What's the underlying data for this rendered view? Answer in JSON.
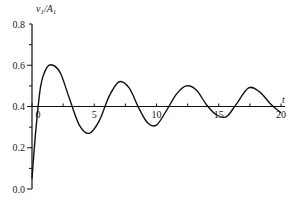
{
  "chart_data": {
    "type": "line",
    "title": "",
    "xlabel": "t",
    "ylabel": "v1/A1",
    "xlim": [
      0,
      20
    ],
    "ylim": [
      0.0,
      0.8
    ],
    "grid": false,
    "legend": null,
    "x_ticks": [
      0,
      5,
      10,
      15,
      20
    ],
    "x_tick_labels": [
      "0",
      "5",
      "10",
      "15",
      "20"
    ],
    "y_ticks": [
      0.0,
      0.2,
      0.4,
      0.6,
      0.8
    ],
    "y_tick_labels": [
      "0.0",
      "0.2",
      "0.4",
      "0.6",
      "0.8"
    ],
    "x_axis_at_y": 0.4,
    "series": [
      {
        "name": "v1/A1",
        "x": [
          0,
          0.3,
          0.7,
          1.2,
          1.7,
          2.3,
          3.0,
          3.8,
          4.6,
          5.4,
          6.2,
          7.0,
          7.8,
          8.6,
          9.3,
          10.0,
          10.8,
          11.6,
          12.4,
          13.2,
          14.0,
          14.8,
          15.6,
          16.4,
          17.4,
          18.3,
          19.2,
          20.0
        ],
        "values": [
          0.05,
          0.28,
          0.5,
          0.59,
          0.6,
          0.56,
          0.44,
          0.31,
          0.27,
          0.33,
          0.45,
          0.52,
          0.49,
          0.39,
          0.32,
          0.31,
          0.38,
          0.46,
          0.5,
          0.48,
          0.41,
          0.36,
          0.35,
          0.41,
          0.49,
          0.47,
          0.41,
          0.37
        ]
      }
    ]
  },
  "labels": {
    "ylabel_main": "v",
    "ylabel_sub": "1",
    "ylabel_div": "/A",
    "ylabel_sub2": "1",
    "xlabel": "t"
  }
}
